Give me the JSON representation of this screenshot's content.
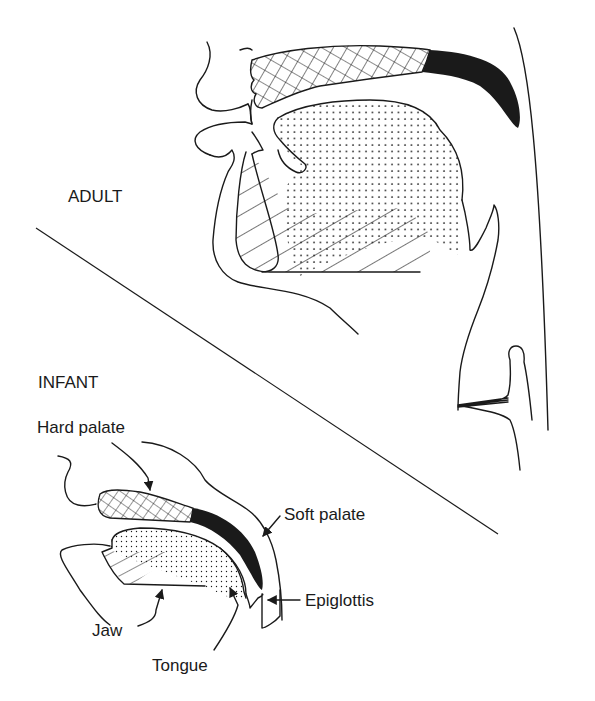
{
  "figure": {
    "sections": {
      "adult": {
        "label": "ADULT"
      },
      "infant": {
        "label": "INFANT"
      }
    },
    "labels": {
      "hard_palate": "Hard palate",
      "soft_palate": "Soft palate",
      "epiglottis": "Epiglottis",
      "jaw": "Jaw",
      "tongue": "Tongue"
    },
    "legend_patterns": {
      "hard_palate": "crosshatch",
      "soft_palate": "solid-black",
      "tongue": "dotted",
      "jaw": "diagonal-hatch"
    },
    "colors": {
      "ink": "#1a1a1a",
      "background": "#ffffff"
    }
  }
}
